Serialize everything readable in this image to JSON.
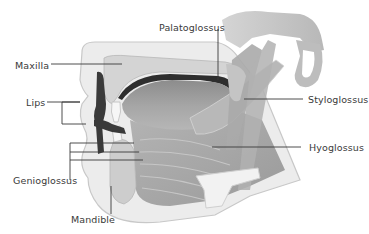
{
  "diagram": {
    "labels": {
      "palatoglossus": "Palatoglossus",
      "maxilla": "Maxilla",
      "lips": "Lips",
      "styloglossus": "Styloglossus",
      "hyoglossus": "Hyoglossus",
      "genioglossus": "Genioglossus",
      "mandible": "Mandible"
    },
    "colors": {
      "leader_line": "#3a3a3a",
      "label_text": "#3a3a3a",
      "soft_tissue": "#e6e6e6",
      "muscle": "#a8a8a8",
      "bone": "#cfcfcf",
      "dark_cavity": "#3c3c3c"
    }
  }
}
